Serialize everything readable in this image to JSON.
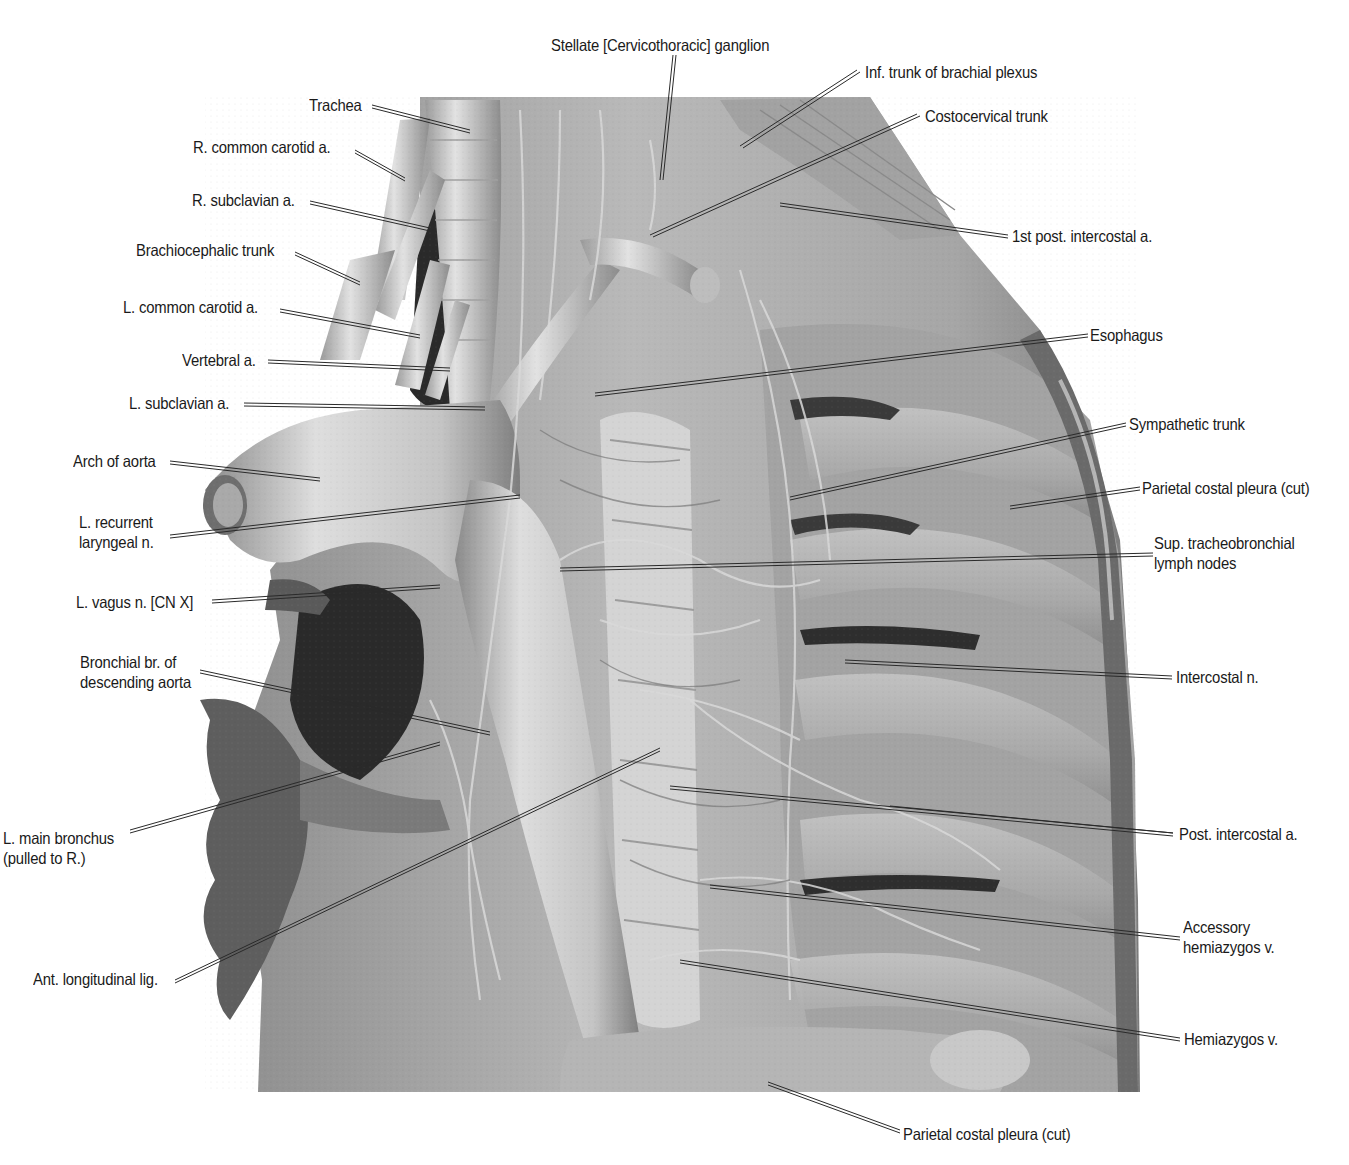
{
  "figure": {
    "type": "anatomical dissection photograph",
    "view": "Left mediastinum, thoracic",
    "colors": {
      "background": "#ffffff",
      "tissue_light": "#d8d8d8",
      "tissue_mid": "#a8a8a8",
      "tissue_dark": "#5a5a5a",
      "label_text": "#1a1a1a",
      "leader_line": "#333333"
    }
  },
  "labels": {
    "left": [
      {
        "id": "trachea",
        "text": "Trachea"
      },
      {
        "id": "r-common-carotid",
        "text": "R. common carotid a."
      },
      {
        "id": "r-subclavian",
        "text": "R. subclavian a."
      },
      {
        "id": "brachiocephalic-trunk",
        "text": "Brachiocephalic trunk"
      },
      {
        "id": "l-common-carotid",
        "text": "L. common carotid a."
      },
      {
        "id": "vertebral",
        "text": "Vertebral a."
      },
      {
        "id": "l-subclavian",
        "text": "L. subclavian a."
      },
      {
        "id": "arch-of-aorta",
        "text": "Arch of aorta"
      },
      {
        "id": "l-recurrent-laryngeal",
        "text": "L. recurrent",
        "text2": "laryngeal n."
      },
      {
        "id": "l-vagus",
        "text": "L. vagus n. [CN X]"
      },
      {
        "id": "bronchial-br",
        "text": "Bronchial br. of",
        "text2": "descending aorta"
      },
      {
        "id": "l-main-bronchus",
        "text": "L. main bronchus",
        "text2": "(pulled to R.)"
      },
      {
        "id": "ant-longitudinal-lig",
        "text": "Ant. longitudinal lig."
      }
    ],
    "top": [
      {
        "id": "stellate-ganglion",
        "text": "Stellate [Cervicothoracic] ganglion"
      },
      {
        "id": "inf-trunk-brachial-plexus",
        "text": "Inf. trunk of brachial plexus"
      },
      {
        "id": "costocervical-trunk",
        "text": "Costocervical trunk"
      }
    ],
    "right": [
      {
        "id": "first-post-intercostal",
        "text": "1st post. intercostal a."
      },
      {
        "id": "esophagus",
        "text": "Esophagus"
      },
      {
        "id": "sympathetic-trunk",
        "text": "Sympathetic trunk"
      },
      {
        "id": "parietal-costal-pleura-right",
        "text": "Parietal costal pleura (cut)"
      },
      {
        "id": "sup-tracheobronchial",
        "text": "Sup. tracheobronchial",
        "text2": "lymph nodes"
      },
      {
        "id": "intercostal-n",
        "text": "Intercostal n."
      },
      {
        "id": "post-intercostal",
        "text": "Post. intercostal a."
      },
      {
        "id": "accessory-hemiazygos",
        "text": "Accessory",
        "text2": "hemiazygos v."
      },
      {
        "id": "hemiazygos",
        "text": "Hemiazygos v."
      }
    ],
    "bottom": [
      {
        "id": "parietal-costal-pleura-bottom",
        "text": "Parietal costal pleura (cut)"
      }
    ]
  }
}
